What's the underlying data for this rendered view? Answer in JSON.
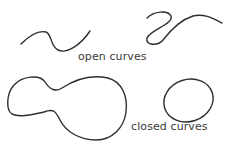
{
  "labels": {
    "open": "open curves",
    "closed": "closed curves"
  },
  "colors": {
    "stroke": "#2e2e2e",
    "text": "#3a3a3a",
    "background": "#ffffff"
  },
  "shapes": [
    {
      "name": "open-curve-1",
      "type": "open"
    },
    {
      "name": "open-curve-2",
      "type": "open"
    },
    {
      "name": "closed-blob",
      "type": "closed"
    },
    {
      "name": "closed-ellipse",
      "type": "closed"
    }
  ]
}
